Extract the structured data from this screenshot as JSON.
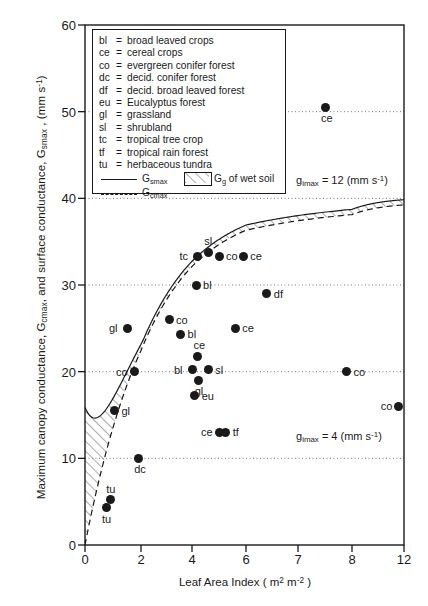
{
  "chart_data": {
    "type": "scatter",
    "title": "",
    "xlabel": "Leaf Area Index  ( m² m⁻² )",
    "ylabel": "Maximum canopy conductance, Gᴄᴍᴀx , and surface conductance, Gₛₘₐₓ , (mm s⁻¹)",
    "xticks": [
      0,
      2,
      4,
      6,
      7,
      8,
      12
    ],
    "xtick_labels": [
      "0",
      "2",
      "4",
      "6",
      "7",
      "8",
      "12"
    ],
    "yticks": [
      0,
      10,
      20,
      30,
      40,
      50,
      60
    ],
    "ytick_labels": [
      "0",
      "10",
      "20",
      "30",
      "40",
      "50",
      "60"
    ],
    "ylim": [
      0,
      60
    ],
    "grid": "horizontal dotted at 10,20,30,40,50",
    "legend_position": "top-left inside box",
    "points": [
      {
        "code": "ce",
        "x": 7.5,
        "y": 50.5,
        "label_pos": "below"
      },
      {
        "code": "sl",
        "x": 4.6,
        "y": 33.8,
        "label_pos": "above"
      },
      {
        "code": "tc",
        "x": 4.2,
        "y": 33.3,
        "label_pos": "left"
      },
      {
        "code": "co",
        "x": 5.0,
        "y": 33.3,
        "label_pos": "right"
      },
      {
        "code": "ce",
        "x": 5.9,
        "y": 33.3,
        "label_pos": "right"
      },
      {
        "code": "bl",
        "x": 4.15,
        "y": 30.0,
        "label_pos": "right"
      },
      {
        "code": "df",
        "x": 6.4,
        "y": 29.0,
        "label_pos": "right"
      },
      {
        "code": "co",
        "x": 3.1,
        "y": 26.0,
        "label_pos": "right"
      },
      {
        "code": "bl",
        "x": 3.55,
        "y": 24.3,
        "label_pos": "right"
      },
      {
        "code": "gl",
        "x": 1.5,
        "y": 25.0,
        "label_pos": "left"
      },
      {
        "code": "ce",
        "x": 5.6,
        "y": 25.0,
        "label_pos": "right"
      },
      {
        "code": "ce",
        "x": 4.2,
        "y": 21.8,
        "label_pos": "above"
      },
      {
        "code": "bl",
        "x": 4.0,
        "y": 20.2,
        "label_pos": "left"
      },
      {
        "code": "sl",
        "x": 4.6,
        "y": 20.2,
        "label_pos": "right"
      },
      {
        "code": "gl",
        "x": 4.25,
        "y": 19.0,
        "label_pos": "below"
      },
      {
        "code": "co",
        "x": 1.75,
        "y": 20.0,
        "label_pos": "left"
      },
      {
        "code": "co",
        "x": 7.9,
        "y": 20.0,
        "label_pos": "right"
      },
      {
        "code": "eu",
        "x": 4.1,
        "y": 17.2,
        "label_pos": "right"
      },
      {
        "code": "co",
        "x": 11.6,
        "y": 16.0,
        "label_pos": "left"
      },
      {
        "code": "gl",
        "x": 1.05,
        "y": 15.5,
        "label_pos": "right"
      },
      {
        "code": "ce",
        "x": 5.0,
        "y": 13.0,
        "label_pos": "left"
      },
      {
        "code": "tf",
        "x": 5.25,
        "y": 13.0,
        "label_pos": "right"
      },
      {
        "code": "dc",
        "x": 1.9,
        "y": 10.0,
        "label_pos": "below"
      },
      {
        "code": "tu",
        "x": 0.9,
        "y": 5.2,
        "label_pos": "above"
      },
      {
        "code": "tu",
        "x": 0.75,
        "y": 4.3,
        "label_pos": "below"
      }
    ],
    "curves": [
      {
        "name": "G_smax",
        "style": "solid",
        "description": "surface conductance upper envelope, rises from ~14 at LAI 0, dips to ~10 near LAI 2, then rises to ~40 asymptote"
      },
      {
        "name": "G_cmax",
        "style": "dashed",
        "description": "maximum canopy conductance, rises from 0 at LAI 0 to ~39 asymptote"
      }
    ],
    "shaded_region": {
      "name": "G_g of wet soil",
      "style": "diagonal hatch between G_smax and G_cmax"
    },
    "annotations": [
      {
        "text": "gᵢₘₐₓ = 12 (mm s⁻¹)",
        "x": 7.0,
        "y": 41.5
      },
      {
        "text": "gᵢₘₐₓ = 4 (mm s⁻¹)",
        "x": 8.4,
        "y": 11.6
      }
    ]
  },
  "axes": {
    "ylabel_parts": {
      "p1": "Maximum canopy conductance,  G",
      "sub1": "cmax",
      "p2": ", and surface conductance,  G",
      "sub2": "smax",
      "p3": " ,  (mm s",
      "sup1": "-1",
      "p4": ")"
    },
    "xlabel_parts": {
      "p1": "Leaf Area Index  ( m",
      "sup1": "2",
      "p2": " m",
      "sup2": "-2",
      "p3": " )"
    },
    "ytick_labels": [
      "60",
      "50",
      "40",
      "30",
      "20",
      "10",
      "0"
    ],
    "xtick_labels": [
      "0",
      "2",
      "4",
      "6",
      "7",
      "8",
      "12"
    ]
  },
  "legend": {
    "entries": [
      {
        "key": "bl",
        "eq": "=",
        "desc": "broad leaved crops"
      },
      {
        "key": "ce",
        "eq": "=",
        "desc": "cereal crops"
      },
      {
        "key": "co",
        "eq": "=",
        "desc": "evergreen conifer forest"
      },
      {
        "key": "dc",
        "eq": "=",
        "desc": "decid. conifer forest"
      },
      {
        "key": "df",
        "eq": "=",
        "desc": "decid. broad leaved forest"
      },
      {
        "key": "eu",
        "eq": "=",
        "desc": "Eucalyptus forest"
      },
      {
        "key": "gl",
        "eq": "=",
        "desc": "grassland"
      },
      {
        "key": "sl",
        "eq": "=",
        "desc": "shrubland"
      },
      {
        "key": "tc",
        "eq": "=",
        "desc": "tropical tree crop"
      },
      {
        "key": "tf",
        "eq": "=",
        "desc": "tropical rain forest"
      },
      {
        "key": "tu",
        "eq": "=",
        "desc": "herbaceous tundra"
      }
    ],
    "curve_solid": {
      "symbol": "G",
      "sub": "smax"
    },
    "curve_dashed": {
      "symbol": "G",
      "sub": "cmax"
    },
    "hatch_label": {
      "symbol": "G",
      "sub": "g",
      "text": " of wet soil"
    }
  },
  "annotations": {
    "upper": {
      "symbol": "g",
      "sub": "imax",
      "eq": " = 12 (mm  s",
      "sup": "-1",
      "close": ")"
    },
    "lower": {
      "symbol": "g",
      "sub": "imax",
      "eq": " = 4 (mm  s",
      "sup": "-1",
      "close": ")"
    }
  },
  "colors": {
    "ink": "#1a1a1a",
    "background": "#ffffff",
    "grid": "#777777"
  }
}
